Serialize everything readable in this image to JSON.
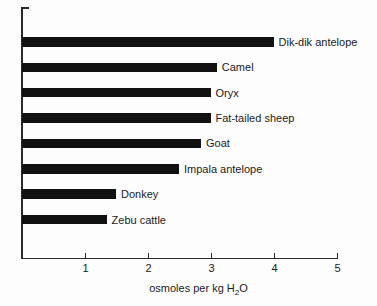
{
  "chart_data": {
    "type": "bar",
    "orientation": "horizontal",
    "categories": [
      "Dik-dik antelope",
      "Camel",
      "Oryx",
      "Fat-tailed sheep",
      "Goat",
      "Impala antelope",
      "Donkey",
      "Zebu cattle"
    ],
    "values": [
      4.0,
      3.1,
      3.0,
      3.0,
      2.85,
      2.5,
      1.5,
      1.35
    ],
    "title": "",
    "xlabel": "osmoles per kg H₂O",
    "xlabel_parts": {
      "prefix": "osmoles per kg H",
      "sub": "2",
      "suffix": "O"
    },
    "ylabel": "",
    "xlim": [
      0,
      5
    ],
    "xticks": [
      "1",
      "2",
      "3",
      "4",
      "5"
    ],
    "grid": false,
    "legend": false,
    "bar_color": "#111111",
    "axis_color": "#2a2a2a",
    "background_color": "#fdfdfd"
  }
}
